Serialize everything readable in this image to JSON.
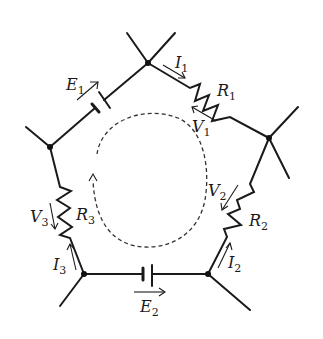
{
  "diagram": {
    "type": "circuit-mesh",
    "nodes": [
      {
        "id": "top",
        "x": 148,
        "y": 63
      },
      {
        "id": "right",
        "x": 269,
        "y": 138
      },
      {
        "id": "bottom-right",
        "x": 208,
        "y": 274
      },
      {
        "id": "bottom-left",
        "x": 84,
        "y": 274
      },
      {
        "id": "left",
        "x": 50,
        "y": 147
      }
    ],
    "labels": {
      "E1": {
        "main": "E",
        "sub": "1"
      },
      "E2": {
        "main": "E",
        "sub": "2"
      },
      "I1": {
        "main": "I",
        "sub": "1"
      },
      "I2": {
        "main": "I",
        "sub": "2"
      },
      "I3": {
        "main": "I",
        "sub": "3"
      },
      "R1": {
        "main": "R",
        "sub": "1"
      },
      "R2": {
        "main": "R",
        "sub": "2"
      },
      "R3": {
        "main": "R",
        "sub": "3"
      },
      "V1": {
        "main": "V",
        "sub": "1"
      },
      "V2": {
        "main": "V",
        "sub": "2"
      },
      "V3": {
        "main": "V",
        "sub": "3"
      }
    },
    "components": [
      {
        "name": "E1",
        "kind": "battery",
        "branch": "left-top"
      },
      {
        "name": "R1",
        "kind": "resistor",
        "branch": "top-right"
      },
      {
        "name": "R2",
        "kind": "resistor",
        "branch": "right-bottom-right"
      },
      {
        "name": "E2",
        "kind": "battery",
        "branch": "bottom-left-bottom-right"
      },
      {
        "name": "R3",
        "kind": "resistor",
        "branch": "left-bottom-left"
      }
    ],
    "loop_direction": "clockwise",
    "colors": {
      "line": "#1a1a1a",
      "background": "#ffffff"
    }
  }
}
